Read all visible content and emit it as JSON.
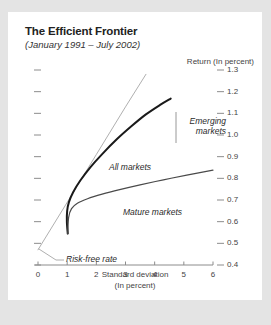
{
  "card": {
    "title": "The Efficient Frontier",
    "subtitle": "(January 1991 – July 2002)"
  },
  "chart_data": {
    "type": "line",
    "title": "The Efficient Frontier",
    "subtitle": "(January 1991 – July 2002)",
    "xlabel": "Standard deviation",
    "xlabel_unit": "(In percent)",
    "ylabel": "Return (In percent)",
    "xlim": [
      0,
      6
    ],
    "ylim": [
      0.4,
      1.3
    ],
    "xticks": [
      0,
      1,
      2,
      3,
      4,
      5,
      6
    ],
    "xticklabels": [
      "0",
      "1",
      "2",
      "3",
      "4",
      "5",
      "6"
    ],
    "yticks": [
      0.4,
      0.5,
      0.6,
      0.7,
      0.8,
      0.9,
      1.0,
      1.1,
      1.2,
      1.3
    ],
    "yticklabels": [
      "0.4",
      "0.5",
      "0.6",
      "0.7",
      "0.8",
      "0.9",
      "1.0",
      "1.1",
      "1.2",
      "1.3"
    ],
    "y_axis_position": "right",
    "grid": false,
    "legend": "inline-annotations",
    "series": [
      {
        "name": "Risk-free rate",
        "style": "straight-tangent-line",
        "color": "#9a9a9a",
        "width": 0.8,
        "points": [
          [
            0.0,
            0.47
          ],
          [
            1.05,
            0.7
          ],
          [
            2.0,
            0.91
          ],
          [
            3.0,
            1.13
          ],
          [
            3.7,
            1.28
          ]
        ]
      },
      {
        "name": "All markets",
        "style": "thick-curve",
        "color": "#1a1a1a",
        "width": 2.0,
        "points": [
          [
            1.02,
            0.545
          ],
          [
            0.99,
            0.6
          ],
          [
            1.0,
            0.65
          ],
          [
            1.06,
            0.69
          ],
          [
            1.2,
            0.735
          ],
          [
            1.45,
            0.79
          ],
          [
            1.8,
            0.852
          ],
          [
            2.2,
            0.912
          ],
          [
            2.7,
            0.98
          ],
          [
            3.2,
            1.04
          ],
          [
            3.7,
            1.095
          ],
          [
            4.2,
            1.14
          ],
          [
            4.55,
            1.168
          ]
        ]
      },
      {
        "name": "Mature markets",
        "style": "medium-curve",
        "color": "#4a4a4a",
        "width": 1.2,
        "points": [
          [
            1.02,
            0.545
          ],
          [
            1.05,
            0.62
          ],
          [
            1.15,
            0.66
          ],
          [
            1.35,
            0.685
          ],
          [
            1.7,
            0.706
          ],
          [
            2.2,
            0.727
          ],
          [
            2.8,
            0.748
          ],
          [
            3.5,
            0.77
          ],
          [
            4.3,
            0.793
          ],
          [
            5.1,
            0.815
          ],
          [
            6.0,
            0.838
          ]
        ]
      }
    ],
    "annotations": [
      {
        "label_line1": "Emerging",
        "label_line2": "markets",
        "target_series": "All markets"
      },
      {
        "label_line1": "All markets",
        "target_series": "All markets"
      },
      {
        "label_line1": "Mature markets",
        "target_series": "Mature markets"
      },
      {
        "label_line1": "Risk-free rate",
        "target_series": "Risk-free rate"
      }
    ]
  }
}
